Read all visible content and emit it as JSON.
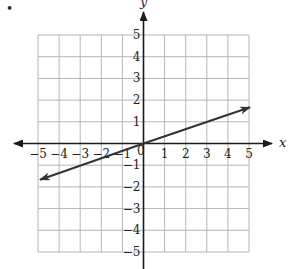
{
  "chart_data": {
    "type": "line",
    "title": "",
    "xlabel": "x",
    "ylabel": "y",
    "xlim": [
      -5,
      5
    ],
    "ylim": [
      -5,
      5
    ],
    "grid": true,
    "x_ticks": [
      -5,
      -4,
      -3,
      -2,
      -1,
      1,
      2,
      3,
      4,
      5
    ],
    "y_ticks": [
      -5,
      -4,
      -3,
      -2,
      -1,
      1,
      2,
      3,
      4,
      5
    ],
    "x_tick_labels": [
      "−5",
      "−4",
      "−3",
      "−2",
      "−1",
      "1",
      "2",
      "3",
      "4",
      "5"
    ],
    "y_tick_labels": [
      "−5",
      "−4",
      "−3",
      "−2",
      "−1",
      "1",
      "2",
      "3",
      "4",
      "5"
    ],
    "origin_label": "0",
    "series": [
      {
        "name": "line",
        "equation": "y = x/3",
        "x": [
          -5,
          5
        ],
        "y": [
          -1.67,
          1.67
        ],
        "arrows": "both"
      }
    ],
    "bullet": "•"
  },
  "colors": {
    "grid": "#b5b5b5",
    "axis": "#1a1a1a",
    "line": "#333333"
  }
}
